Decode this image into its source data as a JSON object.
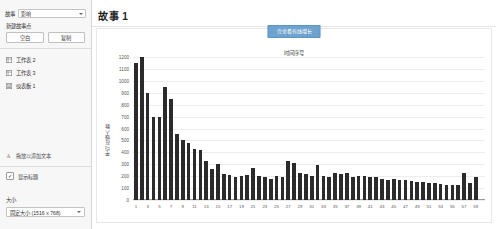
{
  "sidebar": {
    "story_row": {
      "label": "故事",
      "value": "影响",
      "icon": "chevron-down-icon"
    },
    "new_point": {
      "title": "新建故事点",
      "blank_label": "空白",
      "duplicate_label": "复制"
    },
    "nav_items": [
      {
        "label": "工作表 2",
        "icon": "worksheet-icon"
      },
      {
        "label": "工作表 3",
        "icon": "worksheet-icon"
      },
      {
        "label": "仪表板 1",
        "icon": "dashboard-icon"
      }
    ],
    "drop_zone": {
      "label": "拖放以添加文本",
      "icon": "text-drag-icon"
    },
    "show_title": {
      "label": "显示标题",
      "checked": true,
      "mark": "✓"
    },
    "size": {
      "title": "大小",
      "value": "固定大小 (1516 x 768)",
      "icon": "chevron-down-icon"
    }
  },
  "main": {
    "story_title": "故事 1",
    "nav_chip_label": "完全看有线增长"
  },
  "chart_data": {
    "type": "bar",
    "title": "",
    "subtitle": "时间序号",
    "xlabel": "",
    "ylabel": "平均在线人数",
    "ylim": [
      0,
      1200
    ],
    "yticks": [
      0,
      100,
      200,
      300,
      400,
      500,
      600,
      700,
      800,
      900,
      1000,
      1100,
      1200
    ],
    "grid": true,
    "legend": "none",
    "bar_color": "#2b2b2b",
    "categories": [
      1,
      2,
      3,
      4,
      5,
      6,
      7,
      8,
      9,
      10,
      11,
      12,
      13,
      14,
      15,
      16,
      17,
      18,
      19,
      20,
      21,
      22,
      23,
      24,
      25,
      26,
      27,
      28,
      29,
      30,
      31,
      32,
      33,
      34,
      35,
      36,
      37,
      38,
      39,
      40,
      41,
      42,
      43,
      44,
      45,
      46,
      47,
      48,
      49,
      50,
      51,
      52,
      53,
      54,
      55,
      56,
      57,
      58,
      59,
      60
    ],
    "tick_labels_shown": [
      1,
      3,
      5,
      7,
      9,
      11,
      13,
      15,
      17,
      19,
      21,
      23,
      25,
      27,
      29,
      31,
      33,
      35,
      37,
      39,
      41,
      43,
      45,
      47,
      49,
      51,
      53,
      55,
      57,
      59
    ],
    "values": [
      1150,
      1200,
      900,
      700,
      700,
      950,
      850,
      550,
      500,
      480,
      430,
      420,
      330,
      260,
      300,
      220,
      210,
      190,
      200,
      210,
      270,
      200,
      190,
      180,
      200,
      190,
      330,
      310,
      230,
      215,
      200,
      290,
      200,
      195,
      230,
      215,
      230,
      195,
      205,
      200,
      195,
      190,
      180,
      170,
      175,
      170,
      165,
      160,
      155,
      150,
      145,
      140,
      135,
      130,
      125,
      130,
      230,
      145,
      195,
      0
    ]
  }
}
